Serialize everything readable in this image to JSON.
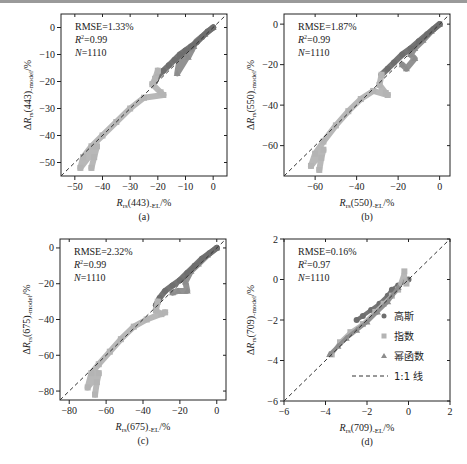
{
  "figure": {
    "colors": {
      "gauss": "#6e6e6e",
      "exp": "#b4b4b4",
      "power": "#8c8c8c",
      "line": "#333333",
      "axis": "#222222"
    },
    "legend": {
      "items": [
        {
          "key": "gauss",
          "label": "高斯",
          "marker": "circle"
        },
        {
          "key": "exp",
          "label": "指数",
          "marker": "square"
        },
        {
          "key": "power",
          "label": "幂函数",
          "marker": "triangle"
        },
        {
          "key": "line",
          "label": "1:1 线",
          "marker": "dashed-line"
        }
      ]
    }
  },
  "chart_data": [
    {
      "id": "a",
      "type": "scatter",
      "caption": "(a)",
      "xlabel": "R_rs(443)_-EL/%",
      "ylabel": "ΔR_rs(443)_-model/%",
      "xlim": [
        -55,
        5
      ],
      "ylim": [
        -55,
        5
      ],
      "xticks": [
        -50,
        -40,
        -30,
        -20,
        -10,
        0
      ],
      "yticks": [
        -50,
        -40,
        -30,
        -20,
        -10,
        0
      ],
      "stats": {
        "rmse": "RMSE=1.33%",
        "r2": "0.99",
        "n": "1110"
      },
      "box": [
        61,
        14,
        227,
        176
      ],
      "series": [
        {
          "name": "幂函数",
          "points": [
            [
              0,
              0
            ],
            [
              -3,
              -2.5
            ],
            [
              -6,
              -5
            ],
            [
              -8,
              -8
            ],
            [
              -10,
              -10
            ],
            [
              -12,
              -11
            ],
            [
              -13,
              -17
            ],
            [
              -7,
              -7
            ],
            [
              -9,
              -11
            ]
          ]
        },
        {
          "name": "高斯",
          "points": [
            [
              0,
              0
            ],
            [
              -2,
              -1.5
            ],
            [
              -4,
              -3.5
            ],
            [
              -6,
              -5.5
            ],
            [
              -8,
              -7
            ],
            [
              -10,
              -8.5
            ],
            [
              -12,
              -10
            ],
            [
              -14,
              -12
            ],
            [
              -16,
              -14
            ],
            [
              -18,
              -16
            ],
            [
              -20,
              -18
            ],
            [
              -21,
              -20
            ]
          ]
        },
        {
          "name": "指数",
          "points": [
            [
              -20,
              -16
            ],
            [
              -21,
              -19
            ],
            [
              -22,
              -21
            ],
            [
              -19,
              -24
            ],
            [
              -18,
              -25
            ],
            [
              -25,
              -26
            ],
            [
              -30,
              -30
            ],
            [
              -35,
              -35
            ],
            [
              -40,
              -40
            ],
            [
              -44,
              -44
            ],
            [
              -47,
              -48
            ],
            [
              -48,
              -52
            ],
            [
              -42,
              -44
            ],
            [
              -43,
              -48
            ],
            [
              -44,
              -52
            ]
          ]
        }
      ]
    },
    {
      "id": "b",
      "type": "scatter",
      "caption": "(b)",
      "xlabel": "R_rs(550)_-EL/%",
      "ylabel": "ΔR_rs(550)_-model/%",
      "xlim": [
        -75,
        5
      ],
      "ylim": [
        -75,
        5
      ],
      "xticks": [
        -60,
        -40,
        -20,
        0
      ],
      "yticks": [
        -60,
        -40,
        -20,
        0
      ],
      "stats": {
        "rmse": "RMSE=1.87%",
        "r2": "0.99",
        "n": "1110"
      },
      "box": [
        284,
        14,
        450,
        176
      ],
      "series": [
        {
          "name": "幂函数",
          "points": [
            [
              0,
              0
            ],
            [
              -4,
              -3.5
            ],
            [
              -8,
              -8
            ],
            [
              -12,
              -12
            ],
            [
              -14,
              -15
            ],
            [
              -12,
              -17
            ],
            [
              -16,
              -22
            ],
            [
              -18,
              -20
            ]
          ]
        },
        {
          "name": "高斯",
          "points": [
            [
              0,
              0
            ],
            [
              -3,
              -2.5
            ],
            [
              -6,
              -5
            ],
            [
              -10,
              -8.5
            ],
            [
              -14,
              -12
            ],
            [
              -18,
              -15
            ],
            [
              -22,
              -19
            ],
            [
              -25,
              -22
            ],
            [
              -28,
              -25
            ]
          ]
        },
        {
          "name": "指数",
          "points": [
            [
              -28,
              -25
            ],
            [
              -29,
              -30
            ],
            [
              -26,
              -34
            ],
            [
              -25,
              -35
            ],
            [
              -32,
              -33
            ],
            [
              -38,
              -37
            ],
            [
              -44,
              -43
            ],
            [
              -50,
              -50
            ],
            [
              -56,
              -58
            ],
            [
              -60,
              -64
            ],
            [
              -62,
              -70
            ],
            [
              -56,
              -62
            ],
            [
              -57,
              -66
            ],
            [
              -58,
              -72
            ]
          ]
        }
      ]
    },
    {
      "id": "c",
      "type": "scatter",
      "caption": "(c)",
      "xlabel": "R_rs(675)_-EL/%",
      "ylabel": "ΔR_rs(675)_-model/%",
      "xlim": [
        -85,
        5
      ],
      "ylim": [
        -85,
        5
      ],
      "xticks": [
        -80,
        -60,
        -40,
        -20,
        0
      ],
      "yticks": [
        -80,
        -60,
        -40,
        -20,
        0
      ],
      "stats": {
        "rmse": "RMSE=2.32%",
        "r2": "0.99",
        "n": "1110"
      },
      "box": [
        60,
        239,
        226,
        400
      ],
      "series": [
        {
          "name": "幂函数",
          "points": [
            [
              0,
              0
            ],
            [
              -5,
              -4
            ],
            [
              -10,
              -9
            ],
            [
              -14,
              -13
            ],
            [
              -17,
              -19
            ],
            [
              -16,
              -24
            ],
            [
              -21,
              -24
            ],
            [
              -24,
              -25
            ]
          ]
        },
        {
          "name": "高斯",
          "points": [
            [
              0,
              0
            ],
            [
              -4,
              -3
            ],
            [
              -8,
              -6
            ],
            [
              -12,
              -10
            ],
            [
              -16,
              -14
            ],
            [
              -20,
              -18
            ],
            [
              -24,
              -21
            ],
            [
              -28,
              -24
            ],
            [
              -31,
              -28
            ],
            [
              -33,
              -32
            ]
          ]
        },
        {
          "name": "指数",
          "points": [
            [
              -32,
              -30
            ],
            [
              -33,
              -35
            ],
            [
              -30,
              -37
            ],
            [
              -28,
              -36
            ],
            [
              -38,
              -40
            ],
            [
              -45,
              -44
            ],
            [
              -52,
              -51
            ],
            [
              -58,
              -58
            ],
            [
              -64,
              -65
            ],
            [
              -68,
              -70
            ],
            [
              -70,
              -78
            ],
            [
              -64,
              -70
            ],
            [
              -65,
              -75
            ],
            [
              -66,
              -82
            ]
          ]
        }
      ]
    },
    {
      "id": "d",
      "type": "scatter",
      "caption": "(d)",
      "xlabel": "R_rs(709)_-EL/%",
      "ylabel": "ΔR_rs(709)_-model/%",
      "xlim": [
        -6,
        2
      ],
      "ylim": [
        -6,
        2
      ],
      "xticks": [
        -6,
        -4,
        -2,
        0,
        2
      ],
      "yticks": [
        -6,
        -4,
        -2,
        0,
        2
      ],
      "stats": {
        "rmse": "RMSE=0.16%",
        "r2": "0.97",
        "n": "1110"
      },
      "box": [
        284,
        239,
        450,
        401
      ],
      "series": [
        {
          "name": "高斯",
          "points": [
            [
              -2.5,
              -2
            ],
            [
              -2.2,
              -1.8
            ],
            [
              -1.8,
              -1.5
            ],
            [
              -1.4,
              -1.2
            ],
            [
              -1.0,
              -0.8
            ],
            [
              -0.8,
              -0.5
            ],
            [
              -0.5,
              -0.3
            ],
            [
              -0.2,
              -0.1
            ],
            [
              0,
              0
            ]
          ]
        },
        {
          "name": "指数",
          "points": [
            [
              -3.7,
              -3.7
            ],
            [
              -3.3,
              -3.1
            ],
            [
              -2.8,
              -2.6
            ],
            [
              -2.2,
              -2.2
            ],
            [
              -1.6,
              -1.6
            ],
            [
              -1.2,
              -1.2
            ],
            [
              -0.8,
              -0.8
            ],
            [
              -0.5,
              -0.5
            ],
            [
              -0.2,
              0.4
            ],
            [
              -0.1,
              -0.2
            ]
          ]
        },
        {
          "name": "幂函数",
          "points": [
            [
              -3.8,
              -3.7
            ],
            [
              -3.4,
              -3.3
            ],
            [
              -3.0,
              -2.9
            ],
            [
              -2.5,
              -2.5
            ],
            [
              -2.0,
              -2.1
            ],
            [
              -1.5,
              -1.6
            ],
            [
              -1.0,
              -1.1
            ],
            [
              -0.5,
              -0.4
            ]
          ]
        }
      ]
    }
  ]
}
